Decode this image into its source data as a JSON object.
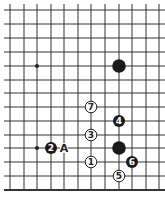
{
  "diagram": {
    "type": "go-board-fragment",
    "grid": {
      "columns_x": [
        10,
        24,
        37,
        51,
        64,
        78,
        91,
        105,
        119,
        132,
        146,
        159
      ],
      "rows_y": [
        10,
        24,
        38,
        52,
        66,
        80,
        93,
        107,
        121,
        135,
        148,
        162,
        176,
        190
      ],
      "line_color": "#333333",
      "edge": "bottom"
    },
    "star_points": [
      {
        "col": 2,
        "row": 4
      },
      {
        "col": 2,
        "row": 10
      }
    ],
    "stones": [
      {
        "color": "black",
        "col": 8,
        "row": 4,
        "label": ""
      },
      {
        "color": "black",
        "col": 8,
        "row": 10,
        "label": ""
      },
      {
        "color": "white",
        "col": 6,
        "row": 11,
        "label": "1"
      },
      {
        "color": "black",
        "col": 3,
        "row": 10,
        "label": "2"
      },
      {
        "color": "white",
        "col": 6,
        "row": 9,
        "label": "3"
      },
      {
        "color": "black",
        "col": 8,
        "row": 8,
        "label": "4"
      },
      {
        "color": "white",
        "col": 8,
        "row": 12,
        "label": "5"
      },
      {
        "color": "black",
        "col": 9,
        "row": 11,
        "label": "6"
      },
      {
        "color": "white",
        "col": 6,
        "row": 7,
        "label": "7"
      }
    ],
    "markers": [
      {
        "col": 4,
        "row": 10,
        "text": "A"
      }
    ]
  }
}
